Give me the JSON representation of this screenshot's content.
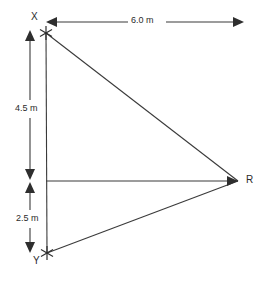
{
  "diagram": {
    "type": "geometry-triangle-with-dimensions",
    "points": [
      {
        "id": "X",
        "label": "X",
        "marker": "star",
        "x": 46,
        "y": 33
      },
      {
        "id": "Y",
        "label": "Y",
        "marker": "star",
        "x": 47,
        "y": 253
      },
      {
        "id": "R",
        "label": "R",
        "marker": "vertex",
        "x": 238,
        "y": 181
      }
    ],
    "segments": [
      {
        "name": "segment-x-y",
        "from": "X",
        "to": "Y"
      },
      {
        "name": "segment-x-r",
        "from": "X",
        "to": "R"
      },
      {
        "name": "segment-y-r",
        "from": "Y",
        "to": "R"
      },
      {
        "name": "segment-mid-r",
        "from": "M",
        "to": "R"
      }
    ],
    "dimensions": [
      {
        "id": "horizontal-distance",
        "label": "6.0 m",
        "value": 6.0,
        "unit": "m",
        "orientation": "horizontal",
        "from": "X",
        "to": "R"
      },
      {
        "id": "upper-vertical-distance",
        "label": "4.5 m",
        "value": 4.5,
        "unit": "m",
        "orientation": "vertical",
        "from": "X",
        "to": "M"
      },
      {
        "id": "lower-vertical-distance",
        "label": "2.5 m",
        "value": 2.5,
        "unit": "m",
        "orientation": "vertical",
        "from": "M",
        "to": "Y"
      }
    ],
    "colors": {
      "stroke": "#3a3a3a",
      "text": "#2b2b2b",
      "background": "#ffffff"
    }
  }
}
